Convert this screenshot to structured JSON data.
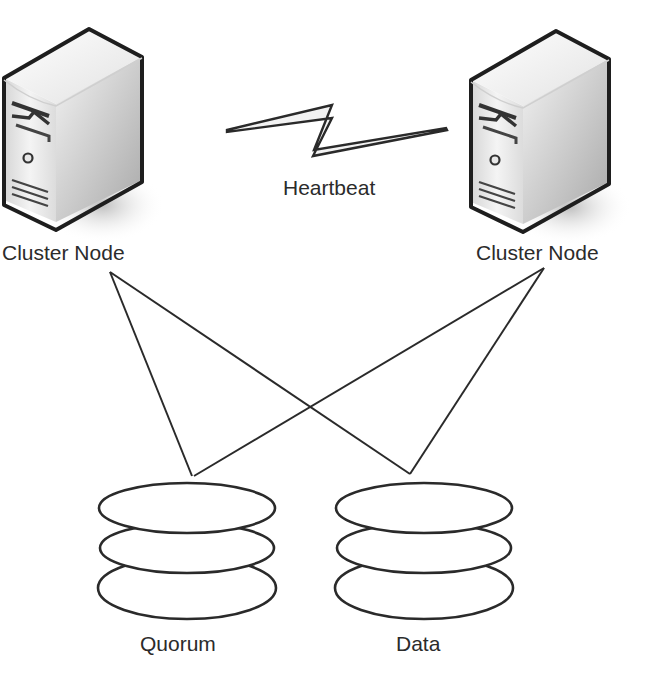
{
  "nodes": [
    {
      "label": "Cluster Node",
      "kind": "server"
    },
    {
      "label": "Cluster Node",
      "kind": "server"
    }
  ],
  "link": {
    "label": "Heartbeat",
    "icon": "lightning-bolt-icon"
  },
  "storage": [
    {
      "label": "Quorum",
      "kind": "disk-stack"
    },
    {
      "label": "Data",
      "kind": "disk-stack"
    }
  ],
  "colors": {
    "stroke": "#2a2a2a",
    "background": "#ffffff"
  }
}
